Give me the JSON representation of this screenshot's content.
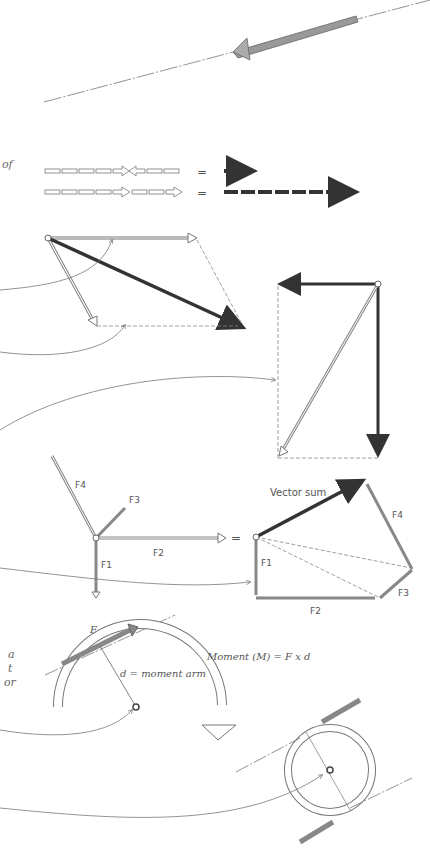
{
  "diagram": {
    "left_text_fragments": [
      "of",
      "a",
      "t",
      "or"
    ],
    "collinear_rows": {
      "equals_symbol": "=",
      "row1_desc": "opposing vectors sum to short resultant",
      "row2_desc": "same-direction vectors sum to long resultant"
    },
    "polygon": {
      "labels": {
        "f1": "F1",
        "f2": "F2",
        "f3": "F3",
        "f4": "F4"
      },
      "resultant_label": "Vector sum",
      "equals_symbol": "="
    },
    "moment": {
      "force_label": "F",
      "arm_label": "d = moment arm",
      "formula": "Moment (M) = F x d"
    },
    "colors": {
      "line": "#666666",
      "dark_arrow": "#333333",
      "hatched_arrow": "#888888"
    }
  }
}
